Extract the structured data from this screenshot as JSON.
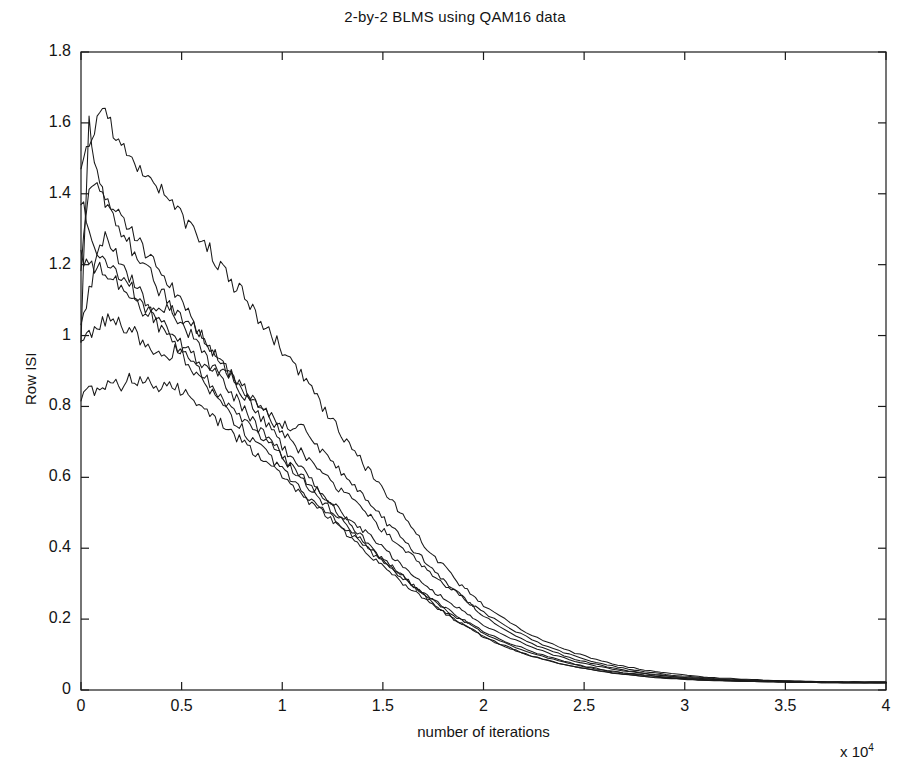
{
  "figure": {
    "background_color": "#ffffff",
    "line_color": "#1a1a1a",
    "axis_color": "#1a1a1a"
  },
  "chart_data": {
    "type": "line",
    "title": "2-by-2 BLMS using QAM16 data",
    "xlabel": "number of iterations",
    "ylabel": "Row ISI",
    "x_exponent_label": "x 10",
    "x_exponent_power": "4",
    "x_scale_factor": 10000,
    "xlim": [
      0,
      4
    ],
    "ylim": [
      0,
      1.8
    ],
    "xticks": [
      0,
      0.5,
      1,
      1.5,
      2,
      2.5,
      3,
      3.5,
      4
    ],
    "xtick_labels": [
      "0",
      "0.5",
      "1",
      "1.5",
      "2",
      "2.5",
      "3",
      "3.5",
      "4"
    ],
    "yticks": [
      0,
      0.2,
      0.4,
      0.6,
      0.8,
      1,
      1.2,
      1.4,
      1.6,
      1.8
    ],
    "ytick_labels": [
      "0",
      "0.2",
      "0.4",
      "0.6",
      "0.8",
      "1",
      "1.2",
      "1.4",
      "1.6",
      "1.8"
    ],
    "grid": false,
    "legend": false,
    "legend_position": "none",
    "series_count": 8,
    "x_sample_step": 0.04,
    "x": [
      0,
      0.04,
      0.08,
      0.12,
      0.16,
      0.2,
      0.24,
      0.28,
      0.32,
      0.36,
      0.4,
      0.44,
      0.48,
      0.52,
      0.56,
      0.6,
      0.64,
      0.68,
      0.72,
      0.76,
      0.8,
      0.84,
      0.88,
      0.92,
      0.96,
      1,
      1.04,
      1.08,
      1.12,
      1.16,
      1.2,
      1.24,
      1.28,
      1.32,
      1.36,
      1.4,
      1.44,
      1.48,
      1.52,
      1.56,
      1.6,
      1.64,
      1.68,
      1.72,
      1.76,
      1.8,
      1.84,
      1.88,
      1.92,
      1.96,
      2,
      2.08,
      2.16,
      2.24,
      2.32,
      2.4,
      2.48,
      2.56,
      2.64,
      2.72,
      2.8,
      2.88,
      2.96,
      3.04,
      3.12,
      3.2,
      3.28,
      3.36,
      3.44,
      3.52,
      3.6,
      3.68,
      3.76,
      3.84,
      3.92,
      4
    ],
    "series": [
      {
        "name": "row-isi-1",
        "start_value": 1.47,
        "peak_value": 1.63,
        "peak_x": 0.1,
        "final_value": 0.022,
        "values": [
          1.47,
          1.54,
          1.61,
          1.63,
          1.58,
          1.53,
          1.5,
          1.48,
          1.43,
          1.43,
          1.41,
          1.37,
          1.35,
          1.32,
          1.3,
          1.27,
          1.24,
          1.2,
          1.17,
          1.14,
          1.12,
          1.09,
          1.05,
          1.02,
          0.99,
          0.96,
          0.93,
          0.9,
          0.87,
          0.83,
          0.8,
          0.77,
          0.73,
          0.7,
          0.67,
          0.64,
          0.61,
          0.58,
          0.55,
          0.52,
          0.49,
          0.46,
          0.43,
          0.4,
          0.37,
          0.35,
          0.33,
          0.3,
          0.28,
          0.26,
          0.24,
          0.21,
          0.18,
          0.155,
          0.135,
          0.115,
          0.1,
          0.086,
          0.074,
          0.065,
          0.057,
          0.05,
          0.045,
          0.04,
          0.036,
          0.033,
          0.031,
          0.029,
          0.027,
          0.026,
          0.025,
          0.024,
          0.023,
          0.023,
          0.022,
          0.022
        ]
      },
      {
        "name": "row-isi-2",
        "start_value": 1.0,
        "peak_value": 1.6,
        "peak_x": 0.04,
        "final_value": 0.021,
        "values": [
          1.0,
          1.6,
          1.46,
          1.38,
          1.36,
          1.33,
          1.3,
          1.27,
          1.24,
          1.21,
          1.18,
          1.14,
          1.11,
          1.07,
          1.04,
          1.0,
          0.97,
          0.94,
          0.9,
          0.87,
          0.84,
          0.81,
          0.78,
          0.75,
          0.72,
          0.69,
          0.66,
          0.63,
          0.61,
          0.58,
          0.55,
          0.53,
          0.5,
          0.48,
          0.45,
          0.43,
          0.4,
          0.38,
          0.36,
          0.34,
          0.32,
          0.3,
          0.28,
          0.26,
          0.24,
          0.22,
          0.21,
          0.19,
          0.18,
          0.165,
          0.15,
          0.13,
          0.112,
          0.096,
          0.083,
          0.072,
          0.063,
          0.055,
          0.048,
          0.043,
          0.038,
          0.035,
          0.032,
          0.029,
          0.027,
          0.026,
          0.025,
          0.024,
          0.023,
          0.022,
          0.022,
          0.021,
          0.021,
          0.021,
          0.021,
          0.021
        ]
      },
      {
        "name": "row-isi-3",
        "start_value": 1.19,
        "peak_value": 1.45,
        "peak_x": 0.06,
        "final_value": 0.022,
        "values": [
          1.19,
          1.43,
          1.45,
          1.38,
          1.34,
          1.3,
          1.26,
          1.22,
          1.19,
          1.16,
          1.12,
          1.09,
          1.05,
          1.02,
          0.99,
          0.96,
          0.92,
          0.89,
          0.86,
          0.83,
          0.8,
          0.77,
          0.74,
          0.71,
          0.69,
          0.66,
          0.63,
          0.61,
          0.58,
          0.56,
          0.53,
          0.51,
          0.49,
          0.46,
          0.44,
          0.42,
          0.4,
          0.38,
          0.36,
          0.34,
          0.32,
          0.3,
          0.28,
          0.265,
          0.25,
          0.23,
          0.215,
          0.2,
          0.19,
          0.175,
          0.16,
          0.14,
          0.12,
          0.104,
          0.09,
          0.078,
          0.068,
          0.059,
          0.052,
          0.046,
          0.041,
          0.037,
          0.033,
          0.031,
          0.029,
          0.027,
          0.026,
          0.025,
          0.024,
          0.023,
          0.023,
          0.022,
          0.022,
          0.022,
          0.022,
          0.022
        ]
      },
      {
        "name": "row-isi-4",
        "start_value": 1.39,
        "peak_value": 1.41,
        "peak_x": 0.02,
        "final_value": 0.02,
        "values": [
          1.39,
          1.3,
          1.24,
          1.22,
          1.19,
          1.17,
          1.14,
          1.11,
          1.08,
          1.05,
          1.02,
          0.99,
          0.96,
          0.93,
          0.9,
          0.87,
          0.84,
          0.82,
          0.79,
          0.76,
          0.74,
          0.71,
          0.69,
          0.67,
          0.64,
          0.62,
          0.6,
          0.57,
          0.55,
          0.53,
          0.51,
          0.49,
          0.47,
          0.45,
          0.43,
          0.41,
          0.39,
          0.37,
          0.35,
          0.33,
          0.315,
          0.3,
          0.28,
          0.265,
          0.25,
          0.235,
          0.22,
          0.205,
          0.19,
          0.18,
          0.165,
          0.145,
          0.126,
          0.109,
          0.094,
          0.081,
          0.07,
          0.061,
          0.053,
          0.047,
          0.042,
          0.038,
          0.034,
          0.031,
          0.029,
          0.027,
          0.025,
          0.024,
          0.023,
          0.022,
          0.022,
          0.021,
          0.021,
          0.02,
          0.02,
          0.02
        ]
      },
      {
        "name": "row-isi-5",
        "start_value": 1.04,
        "peak_value": 1.29,
        "peak_x": 0.1,
        "final_value": 0.023,
        "values": [
          1.04,
          1.12,
          1.21,
          1.29,
          1.24,
          1.2,
          1.17,
          1.14,
          1.1,
          1.07,
          1.04,
          1.01,
          0.99,
          0.96,
          0.93,
          0.9,
          0.87,
          0.84,
          0.81,
          0.79,
          0.76,
          0.74,
          0.72,
          0.7,
          0.68,
          0.66,
          0.63,
          0.61,
          0.59,
          0.57,
          0.55,
          0.53,
          0.51,
          0.49,
          0.47,
          0.45,
          0.43,
          0.41,
          0.39,
          0.37,
          0.35,
          0.33,
          0.31,
          0.29,
          0.275,
          0.26,
          0.245,
          0.23,
          0.215,
          0.2,
          0.185,
          0.16,
          0.14,
          0.12,
          0.104,
          0.09,
          0.078,
          0.068,
          0.059,
          0.052,
          0.046,
          0.041,
          0.037,
          0.034,
          0.031,
          0.029,
          0.027,
          0.026,
          0.025,
          0.024,
          0.024,
          0.023,
          0.023,
          0.023,
          0.023,
          0.023
        ]
      },
      {
        "name": "row-isi-6",
        "start_value": 1.22,
        "peak_value": 1.22,
        "peak_x": 0,
        "final_value": 0.021,
        "values": [
          1.22,
          1.2,
          1.19,
          1.18,
          1.16,
          1.14,
          1.11,
          1.08,
          1.06,
          1.09,
          1.08,
          1.07,
          1.06,
          1.05,
          1.03,
          1.0,
          0.97,
          0.94,
          0.91,
          0.88,
          0.85,
          0.83,
          0.8,
          0.78,
          0.75,
          0.73,
          0.7,
          0.68,
          0.66,
          0.63,
          0.61,
          0.59,
          0.57,
          0.55,
          0.53,
          0.51,
          0.49,
          0.46,
          0.44,
          0.42,
          0.4,
          0.38,
          0.36,
          0.34,
          0.32,
          0.3,
          0.285,
          0.27,
          0.25,
          0.235,
          0.22,
          0.19,
          0.165,
          0.142,
          0.122,
          0.105,
          0.091,
          0.078,
          0.068,
          0.059,
          0.052,
          0.046,
          0.041,
          0.037,
          0.034,
          0.031,
          0.029,
          0.027,
          0.026,
          0.025,
          0.024,
          0.023,
          0.022,
          0.022,
          0.021,
          0.021
        ]
      },
      {
        "name": "row-isi-7",
        "start_value": 0.99,
        "peak_value": 1.05,
        "peak_x": 0.14,
        "final_value": 0.02,
        "values": [
          0.99,
          1.01,
          1.02,
          1.04,
          1.05,
          1.03,
          1.02,
          1.0,
          0.98,
          0.96,
          0.95,
          0.94,
          0.97,
          0.96,
          0.94,
          0.92,
          0.9,
          0.89,
          0.9,
          0.88,
          0.86,
          0.83,
          0.81,
          0.79,
          0.77,
          0.75,
          0.74,
          0.75,
          0.73,
          0.7,
          0.67,
          0.65,
          0.62,
          0.6,
          0.57,
          0.55,
          0.52,
          0.5,
          0.47,
          0.45,
          0.43,
          0.4,
          0.38,
          0.36,
          0.33,
          0.31,
          0.29,
          0.27,
          0.25,
          0.23,
          0.21,
          0.18,
          0.155,
          0.132,
          0.113,
          0.097,
          0.083,
          0.072,
          0.062,
          0.054,
          0.047,
          0.042,
          0.037,
          0.034,
          0.031,
          0.028,
          0.026,
          0.025,
          0.024,
          0.023,
          0.022,
          0.021,
          0.021,
          0.02,
          0.02,
          0.02
        ]
      },
      {
        "name": "row-isi-8",
        "start_value": 0.82,
        "peak_value": 0.885,
        "peak_x": 0.22,
        "final_value": 0.021,
        "values": [
          0.82,
          0.85,
          0.84,
          0.86,
          0.87,
          0.86,
          0.885,
          0.87,
          0.875,
          0.86,
          0.855,
          0.86,
          0.85,
          0.84,
          0.82,
          0.8,
          0.78,
          0.76,
          0.74,
          0.72,
          0.7,
          0.68,
          0.66,
          0.64,
          0.62,
          0.6,
          0.58,
          0.56,
          0.54,
          0.52,
          0.5,
          0.48,
          0.46,
          0.44,
          0.42,
          0.4,
          0.38,
          0.36,
          0.34,
          0.32,
          0.3,
          0.285,
          0.27,
          0.25,
          0.235,
          0.22,
          0.205,
          0.19,
          0.18,
          0.165,
          0.15,
          0.13,
          0.112,
          0.096,
          0.083,
          0.072,
          0.063,
          0.055,
          0.048,
          0.043,
          0.038,
          0.034,
          0.031,
          0.029,
          0.027,
          0.026,
          0.025,
          0.024,
          0.023,
          0.022,
          0.022,
          0.021,
          0.021,
          0.021,
          0.021,
          0.021
        ]
      }
    ]
  }
}
